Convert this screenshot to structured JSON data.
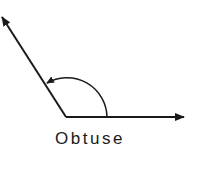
{
  "figure": {
    "label": "Obtuse",
    "angle_type": "obtuse",
    "stroke_color": "#1a1a1a",
    "background_color": "#ffffff",
    "elements": [
      {
        "name": "horizontal-ray",
        "from": [
          66,
          117
        ],
        "to": [
          185,
          117
        ],
        "arrow": "end"
      },
      {
        "name": "oblique-ray",
        "from": [
          66,
          117
        ],
        "to": [
          1,
          16
        ],
        "arrow": "end"
      },
      {
        "name": "angle-arc",
        "from": [
          107,
          117
        ],
        "to": [
          45,
          83
        ],
        "arrow": "end"
      }
    ]
  }
}
